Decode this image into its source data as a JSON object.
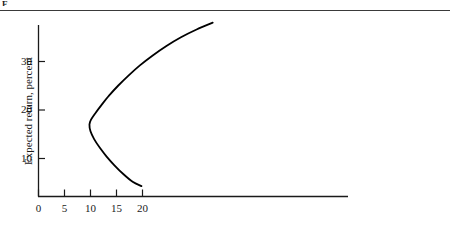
{
  "figure": {
    "caption_remnant": "F",
    "background_color": "#ffffff",
    "ink_color": "#000000",
    "rule_color": "#3a3a3a"
  },
  "chart_data": {
    "type": "line",
    "title": "",
    "subtitle": "",
    "xlabel": "",
    "ylabel": "Expected return, percent",
    "xlim": [
      0,
      59.6
    ],
    "ylim": [
      0,
      41.2
    ],
    "xticks": [
      0,
      5,
      10,
      15,
      20
    ],
    "xtick_labels": [
      "0",
      "5",
      "10",
      "15",
      "20"
    ],
    "yticks": [
      10,
      20,
      30
    ],
    "ytick_labels": [
      "10",
      "20",
      "30"
    ],
    "grid": false,
    "legend": null,
    "legend_position": "none",
    "annotations": [],
    "series": [
      {
        "name": "Minimum-variance frontier",
        "shape": "sideways-parabola",
        "line_color": "#000000",
        "line_width_px": 1.8,
        "description": "Bullet-shaped portfolio opportunity set opening to the right; leftmost vertex is the minimum-variance portfolio.",
        "points": [
          {
            "x": 33.5,
            "y": 38.0
          },
          {
            "x": 30.4,
            "y": 36.6
          },
          {
            "x": 27.4,
            "y": 35.0
          },
          {
            "x": 24.6,
            "y": 33.2
          },
          {
            "x": 21.9,
            "y": 31.2
          },
          {
            "x": 19.5,
            "y": 29.2
          },
          {
            "x": 17.3,
            "y": 27.1
          },
          {
            "x": 15.3,
            "y": 25.0
          },
          {
            "x": 13.6,
            "y": 23.0
          },
          {
            "x": 12.1,
            "y": 21.0
          },
          {
            "x": 10.9,
            "y": 19.3
          },
          {
            "x": 10.1,
            "y": 18.0
          },
          {
            "x": 9.8,
            "y": 17.0
          },
          {
            "x": 10.0,
            "y": 15.6
          },
          {
            "x": 10.7,
            "y": 14.0
          },
          {
            "x": 11.8,
            "y": 12.2
          },
          {
            "x": 13.1,
            "y": 10.4
          },
          {
            "x": 14.6,
            "y": 8.6
          },
          {
            "x": 16.3,
            "y": 6.8
          },
          {
            "x": 18.1,
            "y": 5.2
          },
          {
            "x": 19.8,
            "y": 4.3
          }
        ],
        "endpoints": {
          "top": {
            "x": 33.5,
            "y": 38.0
          },
          "vertex": {
            "x": 9.8,
            "y": 17.5
          },
          "bottom": {
            "x": 19.8,
            "y": 4.3
          }
        }
      }
    ],
    "axes": {
      "x_axis_visible": true,
      "y_axis_visible": true,
      "x_axis_right_extent_units": 59.6,
      "y_axis_top_extent_units": 41.2,
      "tick_direction": "out",
      "spine_color": "#1a1a1a"
    }
  }
}
